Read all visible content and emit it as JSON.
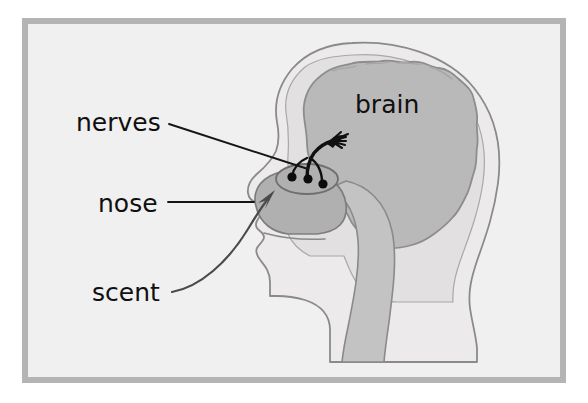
{
  "figure": {
    "type": "anatomical-diagram",
    "background_color": "#f0f0f0",
    "frame_color": "#b4b4b4",
    "page_color": "#ffffff"
  },
  "labels": {
    "nerves": "nerves",
    "nose": "nose",
    "scent": "scent",
    "brain": "brain"
  },
  "colors": {
    "head_fill": "#eceaea",
    "head_outline": "#8a8a8a",
    "skull_fill": "#e2e0e0",
    "brain_fill": "#b9b9b9",
    "brain_outline": "#8d8d8d",
    "nasal_fill": "#b0b0b0",
    "nasal_outline": "#7d7d7d",
    "airway_fill": "#c3c3c3",
    "ink": "#151515"
  },
  "annotations": {
    "nerve_dots_count": 3,
    "nerve_bundle": "olfactory nerve fibers rising from olfactory bulb to brain",
    "scent_arrow": "curved arrow entering the nostril",
    "leader_lines": [
      "nerves-leader",
      "nose-leader",
      "scent-leader"
    ]
  }
}
